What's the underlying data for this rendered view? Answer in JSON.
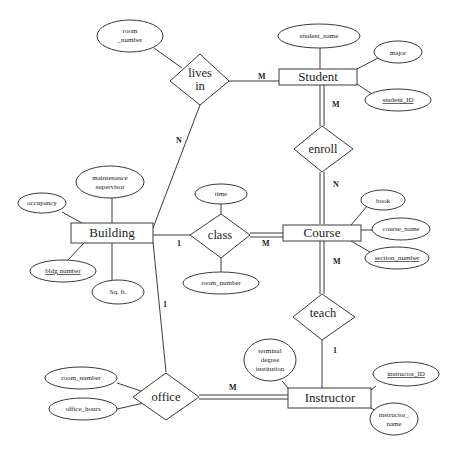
{
  "diagram": {
    "type": "ER diagram",
    "entities": {
      "student": "Student",
      "building": "Building",
      "course": "Course",
      "instructor": "Instructor"
    },
    "relationships": {
      "lives_in": [
        "lives",
        "in"
      ],
      "enroll": "enroll",
      "class": "class",
      "teach": "teach",
      "office": "office"
    },
    "attributes": {
      "lives_in_room_number": [
        "room",
        "_number"
      ],
      "student_name": "student_name",
      "major": "major",
      "student_id": "student_ID",
      "maintenance_supervisor": [
        "maintenance",
        "supervisor"
      ],
      "occupancy": "occupancy",
      "bldg_number": "bldg number",
      "sq_ft": "Sq. ft.",
      "time": "time",
      "class_room_number": "room_number",
      "book": "book",
      "course_name": "course_name",
      "section_number": "section_number",
      "terminal_degree_institution": [
        "terminal",
        "degree",
        "institution"
      ],
      "instructor_id": "instructor_ID",
      "instructor_name": [
        "instructor_",
        "name"
      ],
      "office_room_number": "room_number",
      "office_hours": "office_hours"
    },
    "cardinalities": {
      "lives_in_student": "M",
      "lives_in_building": "N",
      "student_enroll": "M",
      "enroll_course": "N",
      "building_class": "1",
      "class_course": "M",
      "course_teach": "M",
      "teach_instructor": "1",
      "building_office": "1",
      "office_instructor": "M"
    }
  }
}
